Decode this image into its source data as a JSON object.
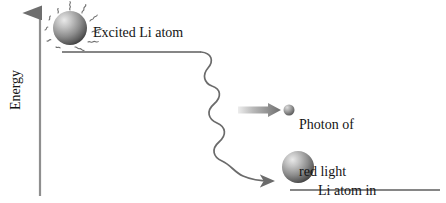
{
  "figure": {
    "type": "diagram",
    "background_color": "#ffffff",
    "ink_color": "#2b2b2b"
  },
  "axis": {
    "label": "Energy",
    "orientation": "vertical",
    "arrow_direction": "up",
    "name": "energy-axis"
  },
  "levels": [
    {
      "id": "upper",
      "name": "excited-energy-level-line",
      "x1": 62,
      "x2": 201,
      "y": 52
    },
    {
      "id": "lower",
      "name": "lower-energy-level-line",
      "x1": 290,
      "x2": 440,
      "y": 190
    }
  ],
  "atoms": [
    {
      "id": "excited-atom",
      "name": "excited-li-atom-sphere",
      "cx": 70,
      "cy": 28,
      "r": 17,
      "excited": true,
      "label": "Excited Li atom",
      "color_light": "#d8d8d8",
      "color_dark": "#4a4a4a"
    },
    {
      "id": "lower-atom",
      "name": "lower-energy-li-atom-sphere",
      "cx": 298,
      "cy": 167,
      "r": 16,
      "excited": false,
      "label_lines": [
        "Li atom in",
        "lower energy state"
      ],
      "color_light": "#d8d8d8",
      "color_dark": "#4a4a4a"
    }
  ],
  "photon": {
    "id": "photon",
    "name": "emitted-photon-sphere",
    "cx": 289,
    "cy": 110,
    "r": 5.5,
    "label_lines": [
      "Photon of",
      "red light",
      "emitted"
    ],
    "color_light": "#cfcfcf",
    "color_dark": "#5a5a5a"
  },
  "arrows": [
    {
      "id": "transition",
      "name": "wavy-transition-arrow",
      "style": "wavy",
      "from": [
        201,
        52
      ],
      "to": [
        272,
        181
      ],
      "description": "squiggly arrow from excited level down to lower level"
    },
    {
      "id": "emission",
      "name": "photon-emission-arrow",
      "style": "straight-gradient",
      "from": [
        240,
        110
      ],
      "to": [
        280,
        110
      ],
      "description": "gray gradient arrow pointing right at the photon"
    }
  ],
  "labels": {
    "excited": "Excited Li atom",
    "photon": {
      "line1": "Photon of",
      "line2": "red light",
      "line3": "emitted"
    },
    "lower": {
      "line1": "Li atom in",
      "line2": "lower energy state"
    },
    "energy": "Energy"
  }
}
